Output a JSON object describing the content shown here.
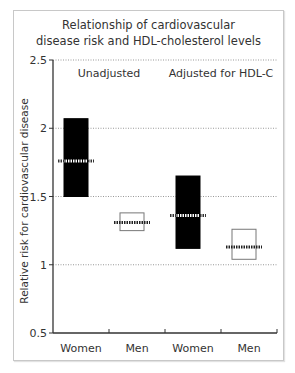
{
  "chart_data": {
    "type": "box",
    "title": "Relationship of cardiovascular disease risk and HDL-cholesterol levels",
    "title_lines": [
      "Relationship of cardiovascular",
      "disease risk and HDL-cholesterol levels"
    ],
    "xlabel": "",
    "ylabel": "Relative risk for cardiovascular disease",
    "ylim": [
      0.5,
      2.5
    ],
    "yticks": [
      0.5,
      1,
      1.5,
      2,
      2.5
    ],
    "ytick_labels": [
      "0.5",
      "1",
      "1.5",
      "2",
      "2.5"
    ],
    "grid": true,
    "groups": [
      {
        "label": "Unadjusted",
        "categories": [
          "Women",
          "Men"
        ]
      },
      {
        "label": "Adjusted for HDL-C",
        "categories": [
          "Women",
          "Men"
        ]
      }
    ],
    "categories": [
      "Women",
      "Men",
      "Women",
      "Men"
    ],
    "series": [
      {
        "name": "Unadjusted - Women",
        "low": 1.5,
        "high": 2.07,
        "estimate": 1.76,
        "fill": "#000000"
      },
      {
        "name": "Unadjusted - Men",
        "low": 1.25,
        "high": 1.38,
        "estimate": 1.31,
        "fill": "#ffffff"
      },
      {
        "name": "Adjusted for HDL-C - Women",
        "low": 1.12,
        "high": 1.65,
        "estimate": 1.36,
        "fill": "#000000"
      },
      {
        "name": "Adjusted for HDL-C - Men",
        "low": 1.04,
        "high": 1.26,
        "estimate": 1.13,
        "fill": "#ffffff"
      }
    ]
  }
}
